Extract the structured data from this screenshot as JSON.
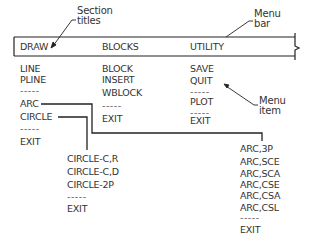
{
  "annotations": {
    "section_titles": [
      "Section",
      "titles"
    ],
    "menu_bar": [
      "Menu",
      "bar"
    ],
    "menu_item": [
      "Menu",
      "item"
    ]
  },
  "menu_bar": {
    "titles": [
      "DRAW",
      "BLOCKS",
      "UTILITY"
    ]
  },
  "columns": {
    "draw": [
      "LINE",
      "PLINE",
      "-----",
      "ARC",
      "CIRCLE",
      "-----",
      "EXIT"
    ],
    "blocks": [
      "BLOCK",
      "INSERT",
      "WBLOCK",
      "-----",
      "EXIT"
    ],
    "utility": [
      "SAVE",
      "QUIT",
      "-----",
      "PLOT",
      "-----",
      "EXIT"
    ]
  },
  "submenus": {
    "circle": [
      "CIRCLE-C,R",
      "CIRCLE-C,D",
      "CIRCLE-2P",
      "-----",
      "EXIT"
    ],
    "arc": [
      "ARC,3P",
      "ARC,SCE",
      "ARC,SCA",
      "ARC,CSE",
      "ARC,CSA",
      "ARC,CSL",
      "-----",
      "EXIT"
    ]
  },
  "colors": {
    "line": "#222222",
    "text": "#333333",
    "background": "#ffffff"
  }
}
